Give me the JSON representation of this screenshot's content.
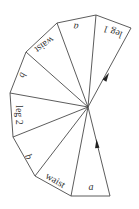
{
  "diagram": {
    "apex": {
      "x": 88,
      "y": 107
    },
    "outer_vertices": [
      {
        "x": 131,
        "y": 28
      },
      {
        "x": 96,
        "y": 15
      },
      {
        "x": 57,
        "y": 23
      },
      {
        "x": 26,
        "y": 52
      },
      {
        "x": 10,
        "y": 93
      },
      {
        "x": 13,
        "y": 137
      },
      {
        "x": 35,
        "y": 176
      },
      {
        "x": 71,
        "y": 196
      },
      {
        "x": 110,
        "y": 196
      }
    ],
    "labels": [
      {
        "text": "leg 1",
        "italic": false,
        "x": 113,
        "y": 31,
        "rotate": 200
      },
      {
        "text": "a",
        "italic": true,
        "x": 76,
        "y": 26,
        "rotate": 185
      },
      {
        "text": "waist",
        "italic": false,
        "x": 44,
        "y": 44,
        "rotate": 145
      },
      {
        "text": "b",
        "italic": true,
        "x": 22,
        "y": 75,
        "rotate": 110
      },
      {
        "text": "leg 2",
        "italic": false,
        "x": 18,
        "y": 115,
        "rotate": 90
      },
      {
        "text": "b",
        "italic": true,
        "x": 28,
        "y": 157,
        "rotate": 65
      },
      {
        "text": "waist",
        "italic": false,
        "x": 55,
        "y": 181,
        "rotate": 30
      },
      {
        "text": "a",
        "italic": true,
        "x": 91,
        "y": 188,
        "rotate": 0
      }
    ],
    "arrows": [
      {
        "name": "arrow-leg1-edge",
        "x": 106,
        "y": 78,
        "rotate": 30
      },
      {
        "name": "arrow-bottom-edge",
        "x": 97,
        "y": 145,
        "rotate": -5
      }
    ],
    "colors": {
      "line": "#4a4a4a",
      "text": "#333333",
      "arrow": "#222222",
      "background": "#ffffff"
    }
  }
}
